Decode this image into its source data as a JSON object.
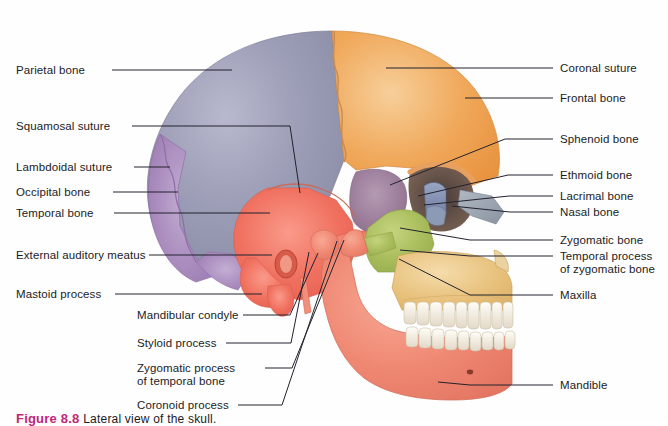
{
  "figure": {
    "caption_number": "Figure 8.8",
    "caption_text": "Lateral view of the skull.",
    "caption_color": "#c0267a"
  },
  "labels_left": [
    {
      "id": "parietal-bone",
      "text": "Parietal bone",
      "x": 16,
      "y": 64,
      "line": [
        [
          112,
          70
        ],
        [
          232,
          70
        ]
      ]
    },
    {
      "id": "squamosal-suture",
      "text": "Squamosal suture",
      "x": 16,
      "y": 120,
      "line": [
        [
          132,
          126
        ],
        [
          290,
          126
        ],
        [
          300,
          193
        ]
      ]
    },
    {
      "id": "lambdoidal-suture",
      "text": "Lambdoidal suture",
      "x": 16,
      "y": 161,
      "line": [
        [
          134,
          167
        ],
        [
          170,
          167
        ]
      ]
    },
    {
      "id": "occipital-bone",
      "text": "Occipital bone",
      "x": 16,
      "y": 186,
      "line": [
        [
          113,
          192
        ],
        [
          178,
          192
        ]
      ]
    },
    {
      "id": "temporal-bone",
      "text": "Temporal bone",
      "x": 16,
      "y": 207,
      "line": [
        [
          114,
          213
        ],
        [
          270,
          213
        ]
      ]
    },
    {
      "id": "external-auditory-meatus",
      "text": "External auditory meatus",
      "x": 16,
      "y": 249,
      "line": [
        [
          149,
          255
        ],
        [
          272,
          255
        ]
      ]
    },
    {
      "id": "mastoid-process",
      "text": "Mastoid process",
      "x": 16,
      "y": 288,
      "line": [
        [
          115,
          294
        ],
        [
          262,
          294
        ]
      ]
    }
  ],
  "labels_lower_left": [
    {
      "id": "mandibular-condyle",
      "text": "Mandibular condyle",
      "x": 137,
      "y": 309,
      "line": [
        [
          243,
          315
        ],
        [
          290,
          315
        ],
        [
          318,
          253
        ]
      ]
    },
    {
      "id": "styloid-process",
      "text": "Styloid process",
      "x": 137,
      "y": 337,
      "line": [
        [
          226,
          343
        ],
        [
          291,
          343
        ],
        [
          309,
          252
        ]
      ]
    },
    {
      "id": "zygomatic-process-temporal",
      "text": "Zygomatic process\nof temporal bone",
      "x": 137,
      "y": 362,
      "line": [
        [
          265,
          368
        ],
        [
          292,
          368
        ],
        [
          344,
          240
        ]
      ]
    },
    {
      "id": "coronoid-process",
      "text": "Coronoid process",
      "x": 137,
      "y": 399,
      "line": [
        [
          238,
          405
        ],
        [
          282,
          405
        ],
        [
          337,
          241
        ]
      ]
    }
  ],
  "labels_right": [
    {
      "id": "coronal-suture",
      "text": "Coronal suture",
      "x": 560,
      "y": 62,
      "line": [
        [
          553,
          68
        ],
        [
          386,
          68
        ]
      ]
    },
    {
      "id": "frontal-bone",
      "text": "Frontal bone",
      "x": 560,
      "y": 92,
      "line": [
        [
          553,
          98
        ],
        [
          465,
          98
        ]
      ]
    },
    {
      "id": "sphenoid-bone",
      "text": "Sphenoid bone",
      "x": 560,
      "y": 133,
      "line": [
        [
          553,
          139
        ],
        [
          505,
          139
        ],
        [
          390,
          185
        ]
      ]
    },
    {
      "id": "ethmoid-bone",
      "text": "Ethmoid bone",
      "x": 560,
      "y": 169,
      "line": [
        [
          553,
          175
        ],
        [
          508,
          175
        ],
        [
          418,
          196
        ]
      ]
    },
    {
      "id": "lacrimal-bone",
      "text": "Lacrimal bone",
      "x": 560,
      "y": 190,
      "line": [
        [
          553,
          196
        ],
        [
          509,
          196
        ],
        [
          424,
          205
        ]
      ]
    },
    {
      "id": "nasal-bone",
      "text": "Nasal bone",
      "x": 560,
      "y": 206,
      "line": [
        [
          553,
          212
        ],
        [
          510,
          212
        ],
        [
          452,
          206
        ]
      ]
    },
    {
      "id": "zygomatic-bone",
      "text": "Zygomatic bone",
      "x": 560,
      "y": 234,
      "line": [
        [
          553,
          240
        ],
        [
          470,
          240
        ],
        [
          400,
          228
        ]
      ]
    },
    {
      "id": "temporal-process-zygomatic",
      "text": "Temporal process\nof zygomatic bone",
      "x": 560,
      "y": 250,
      "line": [
        [
          553,
          256
        ],
        [
          470,
          256
        ],
        [
          400,
          250
        ]
      ]
    },
    {
      "id": "maxilla",
      "text": "Maxilla",
      "x": 560,
      "y": 289,
      "line": [
        [
          553,
          295
        ],
        [
          470,
          295
        ],
        [
          399,
          259
        ]
      ]
    },
    {
      "id": "mandible",
      "text": "Mandible",
      "x": 560,
      "y": 379,
      "line": [
        [
          553,
          385
        ],
        [
          470,
          385
        ],
        [
          438,
          382
        ]
      ]
    }
  ],
  "bone_colors": {
    "parietal": "#9a9bb4",
    "frontal": "#f0a85a",
    "occipital": "#a98bbd",
    "temporal": "#f0705f",
    "sphenoid": "#9b7d99",
    "zygomatic": "#a9bd5c",
    "maxilla": "#e8c27e",
    "mandible": "#ef8873",
    "nasal": "#9aa3ae",
    "ethmoid": "#7a86a8",
    "lacrimal": "#8b9ab5",
    "teeth": "#f6f0e6",
    "outline": "#b3724f"
  }
}
